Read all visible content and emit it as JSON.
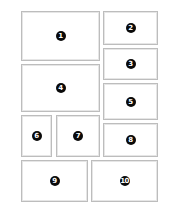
{
  "diagram": {
    "type": "layout-grid",
    "border_color": "#bdbdbd",
    "badge_color": "#0a0a0a",
    "badge_text_color": "#ffffff",
    "panels": [
      {
        "label": "1",
        "x": 21,
        "y": 11,
        "w": 79,
        "h": 50
      },
      {
        "label": "2",
        "x": 103,
        "y": 11,
        "w": 55,
        "h": 34
      },
      {
        "label": "3",
        "x": 103,
        "y": 48,
        "w": 55,
        "h": 32
      },
      {
        "label": "4",
        "x": 21,
        "y": 64,
        "w": 79,
        "h": 48
      },
      {
        "label": "5",
        "x": 103,
        "y": 83,
        "w": 55,
        "h": 37
      },
      {
        "label": "6",
        "x": 21,
        "y": 115,
        "w": 31,
        "h": 42
      },
      {
        "label": "7",
        "x": 56,
        "y": 115,
        "w": 44,
        "h": 42
      },
      {
        "label": "8",
        "x": 103,
        "y": 123,
        "w": 55,
        "h": 34
      },
      {
        "label": "9",
        "x": 21,
        "y": 160,
        "w": 67,
        "h": 42
      },
      {
        "label": "10",
        "x": 91,
        "y": 160,
        "w": 67,
        "h": 42
      }
    ]
  }
}
